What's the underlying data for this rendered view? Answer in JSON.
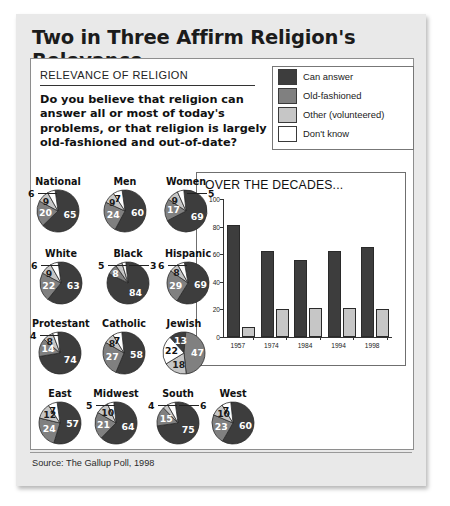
{
  "title": "Two in Three Affirm Religion's Relevance",
  "section_label": "RELEVANCE OF RELIGION",
  "question": "Do you believe that religion can answer all or most of today's problems, or that religion is largely old-fashioned and out-of-date?",
  "source": "Source: The Gallup Poll, 1998",
  "colors": {
    "can_answer": "#3d3d3d",
    "old_fashioned": "#808080",
    "other": "#c6c6c6",
    "dont_know": "#ffffff",
    "card_bg": "#e9e9e9",
    "panel_bg": "#ffffff"
  },
  "legend": [
    {
      "label": "Can answer",
      "color": "#3d3d3d"
    },
    {
      "label": "Old-fashioned",
      "color": "#808080"
    },
    {
      "label": "Other (volunteered)",
      "color": "#c6c6c6"
    },
    {
      "label": "Don't know",
      "color": "#ffffff"
    }
  ],
  "chart_data": [
    {
      "type": "pie",
      "title": "National",
      "categories": [
        "Can answer",
        "Old-fashioned",
        "Other (volunteered)",
        "Don't know"
      ],
      "values": [
        65,
        20,
        9,
        6
      ]
    },
    {
      "type": "pie",
      "title": "Men",
      "categories": [
        "Can answer",
        "Old-fashioned",
        "Other (volunteered)",
        "Don't know"
      ],
      "values": [
        60,
        24,
        9,
        7
      ]
    },
    {
      "type": "pie",
      "title": "Women",
      "categories": [
        "Can answer",
        "Old-fashioned",
        "Other (volunteered)",
        "Don't know"
      ],
      "values": [
        69,
        17,
        9,
        5
      ]
    },
    {
      "type": "pie",
      "title": "White",
      "categories": [
        "Can answer",
        "Old-fashioned",
        "Other (volunteered)",
        "Don't know"
      ],
      "values": [
        63,
        22,
        9,
        6
      ]
    },
    {
      "type": "pie",
      "title": "Black",
      "categories": [
        "Can answer",
        "Old-fashioned",
        "Other (volunteered)",
        "Don't know"
      ],
      "values": [
        84,
        8,
        5,
        3
      ]
    },
    {
      "type": "pie",
      "title": "Hispanic",
      "categories": [
        "Can answer",
        "Old-fashioned",
        "Other (volunteered)",
        "Don't know"
      ],
      "values": [
        69,
        29,
        8,
        6
      ]
    },
    {
      "type": "pie",
      "title": "Protestant",
      "categories": [
        "Can answer",
        "Old-fashioned",
        "Other (volunteered)",
        "Don't know"
      ],
      "values": [
        74,
        14,
        8,
        4
      ]
    },
    {
      "type": "pie",
      "title": "Catholic",
      "categories": [
        "Can answer",
        "Old-fashioned",
        "Other (volunteered)",
        "Don't know"
      ],
      "values": [
        58,
        27,
        8,
        7
      ]
    },
    {
      "type": "pie",
      "title": "Jewish",
      "categories": [
        "Can answer",
        "Old-fashioned",
        "Other (volunteered)",
        "Don't know"
      ],
      "values": [
        13,
        47,
        18,
        22
      ]
    },
    {
      "type": "pie",
      "title": "East",
      "categories": [
        "Can answer",
        "Old-fashioned",
        "Other (volunteered)",
        "Don't know"
      ],
      "values": [
        57,
        24,
        12,
        7
      ]
    },
    {
      "type": "pie",
      "title": "Midwest",
      "categories": [
        "Can answer",
        "Old-fashioned",
        "Other (volunteered)",
        "Don't know"
      ],
      "values": [
        64,
        21,
        10,
        5
      ]
    },
    {
      "type": "pie",
      "title": "South",
      "categories": [
        "Can answer",
        "Old-fashioned",
        "Other (volunteered)",
        "Don't know"
      ],
      "values": [
        75,
        15,
        4,
        6
      ]
    },
    {
      "type": "pie",
      "title": "West",
      "categories": [
        "Can answer",
        "Old-fashioned",
        "Other (volunteered)",
        "Don't know"
      ],
      "values": [
        60,
        23,
        10,
        7
      ]
    },
    {
      "type": "bar",
      "title": "OVER THE DECADES...",
      "categories": [
        "1957",
        "1974",
        "1984",
        "1994",
        "1998"
      ],
      "series": [
        {
          "name": "Can answer",
          "color": "#3d3d3d",
          "values": [
            81,
            62,
            56,
            62,
            65
          ]
        },
        {
          "name": "Old-fashioned",
          "color": "#c6c6c6",
          "values": [
            7,
            20,
            21,
            21,
            20
          ]
        }
      ],
      "ylim": [
        0,
        100
      ],
      "yticks": [
        0,
        20,
        40,
        60,
        80,
        100
      ],
      "xlabel": "",
      "ylabel": "",
      "grid": false,
      "legend_position": "none"
    }
  ]
}
